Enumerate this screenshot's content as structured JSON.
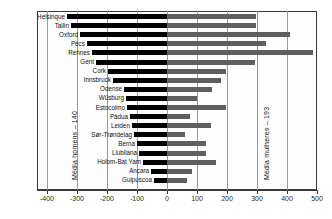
{
  "chart_data": {
    "type": "bar",
    "orientation": "horizontal",
    "style": "diverging-bar",
    "title": "",
    "subtitle": "",
    "xlabel": "",
    "ylabel": "",
    "xlim": [
      -450,
      530
    ],
    "grid": true,
    "legend_position": "none",
    "xticks": [
      -400,
      -300,
      -200,
      -100,
      0,
      100,
      200,
      300,
      400,
      500
    ],
    "xticklabels": [
      "-400",
      "-300",
      "-200",
      "-100",
      "0",
      "100",
      "200",
      "300",
      "400",
      "500"
    ],
    "categories": [
      "Helsinque",
      "Tallin",
      "Oxford",
      "Pécs",
      "Rennes",
      "Gent",
      "Cork",
      "Innsbruck",
      "Odense",
      "Wűsburg",
      "Estocolmo",
      "Pádua",
      "Leiden",
      "Sør-Trøndelag",
      "Berna",
      "Liubliana",
      "Holom-Bat Yam",
      "Ancara",
      "Guipúscoa"
    ],
    "series": [
      {
        "name": "homens",
        "color": "#000000",
        "values": [
          -333,
          -320,
          -290,
          -267,
          -250,
          -237,
          -197,
          -180,
          -143,
          -137,
          -133,
          -123,
          -117,
          -110,
          -100,
          -93,
          -80,
          -53,
          -43
        ]
      },
      {
        "name": "mulheres",
        "color": "#5f5f5f",
        "values": [
          295,
          297,
          410,
          330,
          487,
          292,
          197,
          180,
          150,
          100,
          197,
          77,
          147,
          60,
          130,
          130,
          163,
          83,
          67
        ]
      }
    ],
    "annotations": [
      {
        "name": "media-homens",
        "text": "Média homens – 140",
        "value": -140,
        "orientation": "vertical"
      },
      {
        "name": "media-mulheres",
        "text": "Média mulheres – 193",
        "value": 193,
        "orientation": "vertical"
      }
    ]
  }
}
